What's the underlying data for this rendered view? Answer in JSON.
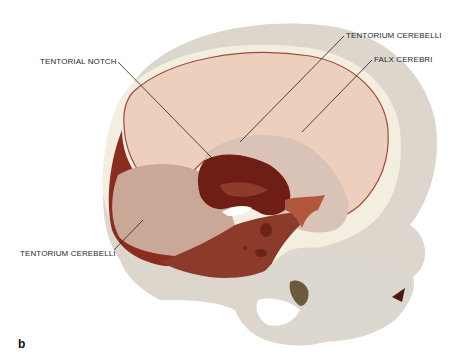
{
  "figure": {
    "panel_letter": "b",
    "colors": {
      "bone": "#dcd6cd",
      "bone_light": "#e8e3da",
      "bone_edge": "#f4efdc",
      "dura_light": "#eccfbd",
      "dura_mid": "#c8a596",
      "dura_dark": "#7a2418",
      "dura_deep": "#5e1810"
    }
  },
  "labels": [
    {
      "id": "tentorial-notch",
      "text": "TENTORIAL NOTCH"
    },
    {
      "id": "tentorium-cerebelli-top",
      "text": "TENTORIUM CEREBELLI"
    },
    {
      "id": "falx-cerebri",
      "text": "FALX CEREBRI"
    },
    {
      "id": "tentorium-cerebelli-left",
      "text": "TENTORIUM CEREBELLI"
    }
  ]
}
